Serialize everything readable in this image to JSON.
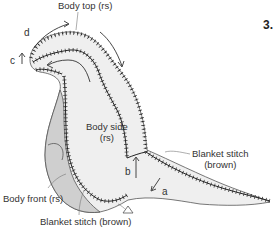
{
  "step_number": "3.",
  "labels": {
    "body_top": "Body top (rs)",
    "body_side_line1": "Body side",
    "body_side_line2": "(rs)",
    "blanket_right_line1": "Blanket stitch",
    "blanket_right_line2": "(brown)",
    "body_front": "Body front (rs)",
    "blanket_bottom": "Blanket stitch (brown)"
  },
  "markers": {
    "a": "a",
    "b": "b",
    "c": "c",
    "d": "d"
  },
  "colors": {
    "body_fill": "#efefef",
    "front_fill": "#cfcfcf",
    "outline": "#555555",
    "stitch": "#222222"
  }
}
